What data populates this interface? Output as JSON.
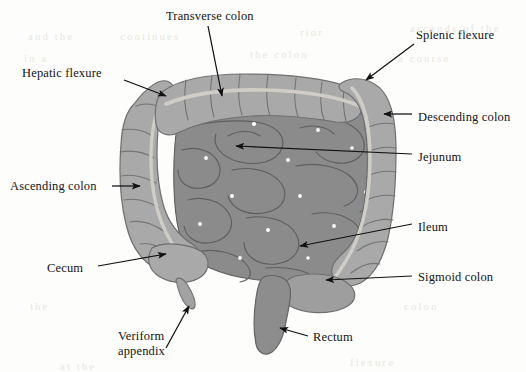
{
  "figure": {
    "background_color": "#fdfdfb",
    "colors": {
      "colon_fill": "#a9a9a9",
      "colon_outline": "#6f6f6f",
      "colon_taenia": "#cfcdc6",
      "small_intestine_fill": "#8b8b8b",
      "small_intestine_outline": "#5e5e5e",
      "rectum_fill": "#8d8d8d",
      "leader_line": "#111111",
      "label_text": "#141414"
    }
  },
  "labels": [
    {
      "id": "transverse-colon",
      "text": "Transverse colon",
      "x": 166,
      "y": 9,
      "anchor": "left",
      "pointer": "arrow-down"
    },
    {
      "id": "splenic-flexure",
      "text": "Splenic flexure",
      "x": 416,
      "y": 28,
      "anchor": "left",
      "pointer": "arrow-down-left"
    },
    {
      "id": "hepatic-flexure",
      "text": "Hepatic flexure",
      "x": 22,
      "y": 66,
      "anchor": "left",
      "pointer": "arrow-down-right"
    },
    {
      "id": "descending-colon",
      "text": "Descending colon",
      "x": 418,
      "y": 110,
      "anchor": "left",
      "pointer": "arrow-left"
    },
    {
      "id": "jejunum",
      "text": "Jejunum",
      "x": 418,
      "y": 150,
      "anchor": "left",
      "pointer": "line-left"
    },
    {
      "id": "ascending-colon",
      "text": "Ascending colon",
      "x": 10,
      "y": 179,
      "anchor": "left",
      "pointer": "arrow-right"
    },
    {
      "id": "ileum",
      "text": "Ileum",
      "x": 418,
      "y": 220,
      "anchor": "left",
      "pointer": "line-left"
    },
    {
      "id": "cecum",
      "text": "Cecum",
      "x": 47,
      "y": 261,
      "anchor": "left",
      "pointer": "arrow-right"
    },
    {
      "id": "sigmoid-colon",
      "text": "Sigmoid colon",
      "x": 418,
      "y": 270,
      "anchor": "left",
      "pointer": "arrow-left"
    },
    {
      "id": "rectum",
      "text": "Rectum",
      "x": 313,
      "y": 330,
      "anchor": "left",
      "pointer": "arrow-left"
    },
    {
      "id": "veriform-appendix",
      "text": "Veriform appendix",
      "line1": "Veriform",
      "line2": "appendix",
      "x": 118,
      "y": 329,
      "anchor": "left",
      "pointer": "arrow-up-right"
    }
  ],
  "structures": [
    {
      "id": "transverse-colon",
      "name": "Transverse colon",
      "region": "upper-horizontal-arc"
    },
    {
      "id": "hepatic-flexure",
      "name": "Hepatic flexure",
      "region": "upper-left-bend"
    },
    {
      "id": "splenic-flexure",
      "name": "Splenic flexure",
      "region": "upper-right-bend"
    },
    {
      "id": "ascending-colon",
      "name": "Ascending colon",
      "region": "left-vertical"
    },
    {
      "id": "descending-colon",
      "name": "Descending colon",
      "region": "right-vertical"
    },
    {
      "id": "cecum",
      "name": "Cecum",
      "region": "lower-left-pouch"
    },
    {
      "id": "veriform-appendix",
      "name": "Veriform appendix",
      "region": "lower-left-tail"
    },
    {
      "id": "sigmoid-colon",
      "name": "Sigmoid colon",
      "region": "lower-right-curve"
    },
    {
      "id": "rectum",
      "name": "Rectum",
      "region": "bottom-center"
    },
    {
      "id": "jejunum",
      "name": "Jejunum",
      "region": "center-upper-coils"
    },
    {
      "id": "ileum",
      "name": "Ileum",
      "region": "center-lower-coils"
    }
  ],
  "bleed_through": [
    {
      "x": 28,
      "y": 30,
      "text": "and the"
    },
    {
      "x": 120,
      "y": 30,
      "text": "continues"
    },
    {
      "x": 300,
      "y": 26,
      "text": "rior"
    },
    {
      "x": 410,
      "y": 22,
      "text": "ascends of the"
    },
    {
      "x": 24,
      "y": 52,
      "text": "in a"
    },
    {
      "x": 250,
      "y": 48,
      "text": "the colon"
    },
    {
      "x": 398,
      "y": 52,
      "text": "a course"
    },
    {
      "x": 30,
      "y": 300,
      "text": "the"
    },
    {
      "x": 404,
      "y": 300,
      "text": "colon"
    },
    {
      "x": 60,
      "y": 360,
      "text": "at the"
    },
    {
      "x": 350,
      "y": 356,
      "text": "flexure"
    }
  ]
}
